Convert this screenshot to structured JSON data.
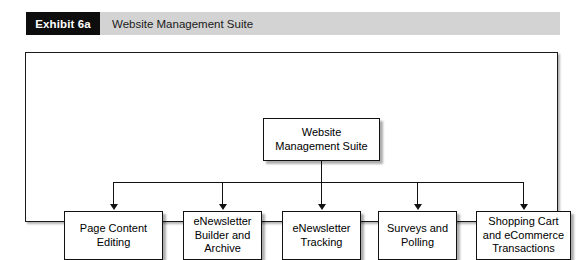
{
  "header": {
    "exhibit_tag": "Exhibit 6a",
    "caption": "Website Management Suite",
    "tag_background": "#0d0d0d",
    "tag_color": "#ffffff",
    "band_background": "#d3d3d3"
  },
  "diagram": {
    "type": "org-tree",
    "root": {
      "label": "Website\nManagement Suite",
      "line1": "Website",
      "line2": "Management Suite"
    },
    "children": [
      {
        "line1": "Page Content",
        "line2": "Editing",
        "line3": ""
      },
      {
        "line1": "eNewsletter",
        "line2": "Builder and",
        "line3": "Archive"
      },
      {
        "line1": "eNewsletter",
        "line2": "Tracking",
        "line3": ""
      },
      {
        "line1": "Surveys and",
        "line2": "Polling",
        "line3": ""
      },
      {
        "line1": "Shopping Cart",
        "line2": "and eCommerce",
        "line3": "Transactions"
      }
    ],
    "line_color": "#111111",
    "node_fill": "#ffffff"
  }
}
